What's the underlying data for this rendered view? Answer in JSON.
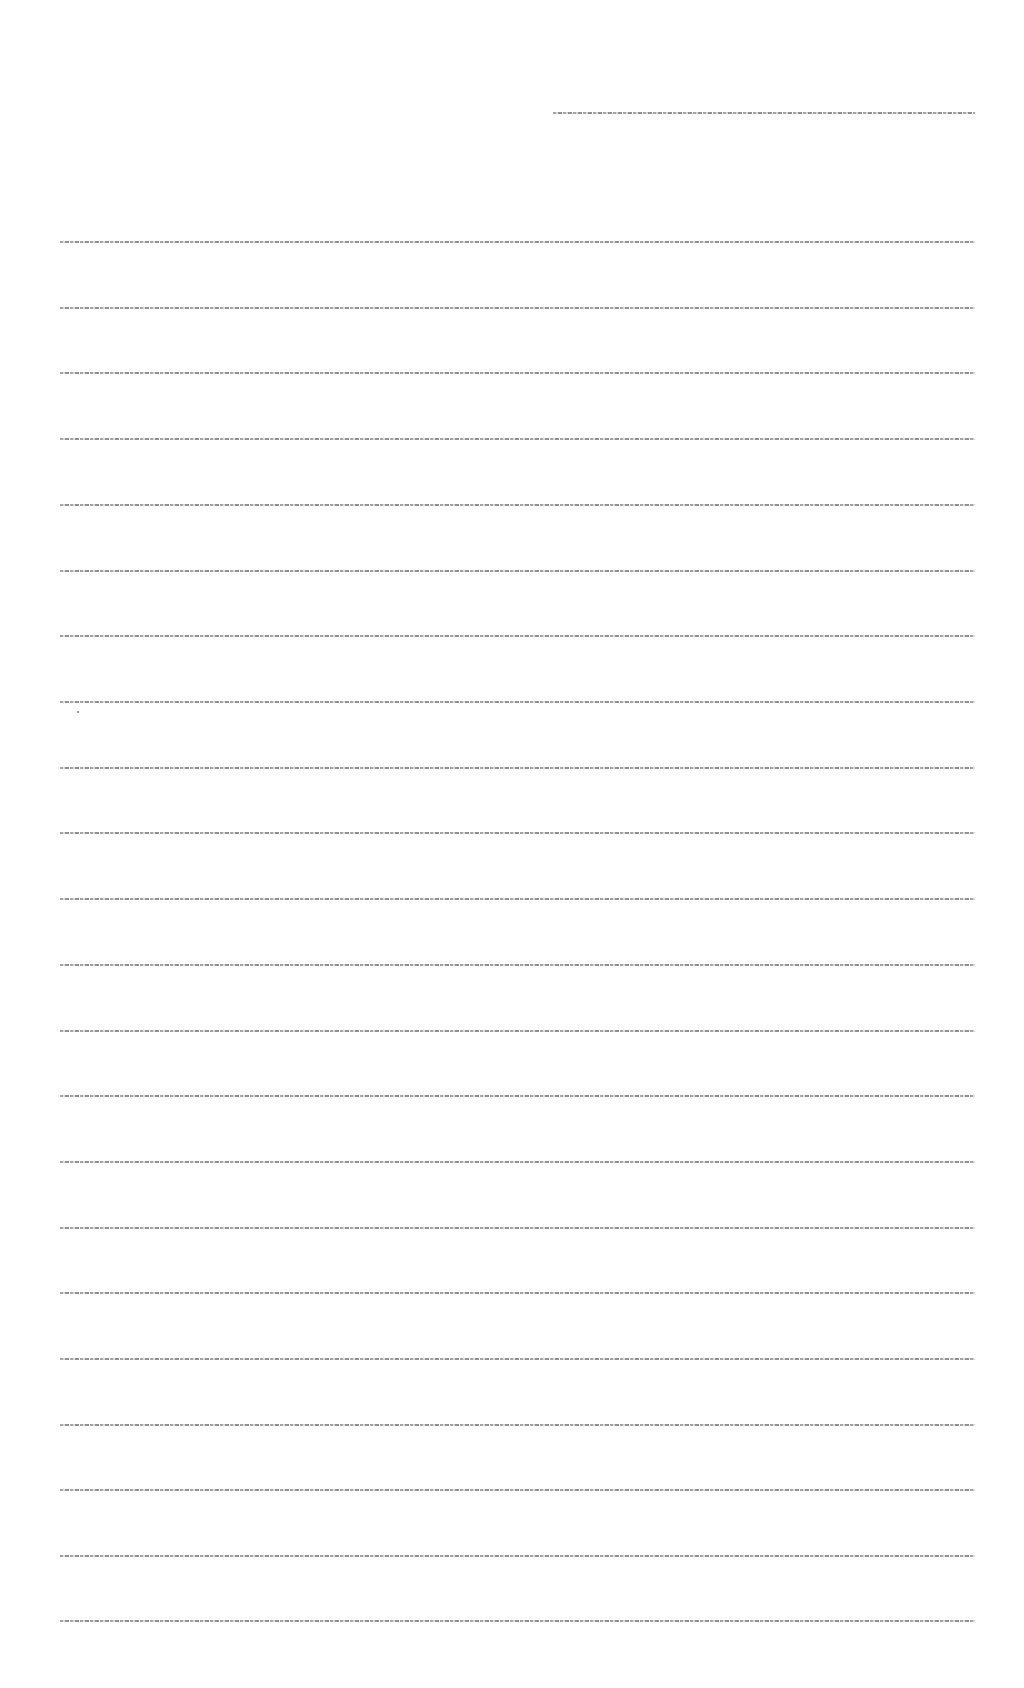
{
  "document": {
    "header_line": {
      "text": "[illegible text line]",
      "top": 112
    },
    "body_lines": [
      {
        "text": "[illegible text line]",
        "top": 241
      },
      {
        "text": "[illegible text line]",
        "top": 307
      },
      {
        "text": "[illegible text line]",
        "top": 372
      },
      {
        "text": "[illegible text line]",
        "top": 438
      },
      {
        "text": "[illegible text line]",
        "top": 504
      },
      {
        "text": "[illegible text line]",
        "top": 570
      },
      {
        "text": "[illegible text line]",
        "top": 635
      },
      {
        "text": "[illegible text line]",
        "top": 701
      },
      {
        "text": "[illegible text line]",
        "top": 767
      },
      {
        "text": "[illegible text line]",
        "top": 832
      },
      {
        "text": "[illegible text line]",
        "top": 898
      },
      {
        "text": "[illegible text line]",
        "top": 964
      },
      {
        "text": "[illegible text line]",
        "top": 1030
      },
      {
        "text": "[illegible text line]",
        "top": 1095
      },
      {
        "text": "[illegible text line]",
        "top": 1161
      },
      {
        "text": "[illegible text line]",
        "top": 1227
      },
      {
        "text": "[illegible text line]",
        "top": 1292
      },
      {
        "text": "[illegible text line]",
        "top": 1358
      },
      {
        "text": "[illegible text line]",
        "top": 1424
      },
      {
        "text": "[illegible text line]",
        "top": 1489
      },
      {
        "text": "[illegible text line]",
        "top": 1555
      },
      {
        "text": "[illegible text line]",
        "top": 1620
      }
    ]
  },
  "colors": {
    "background": "#ffffff",
    "text": "#5a5a5a"
  }
}
